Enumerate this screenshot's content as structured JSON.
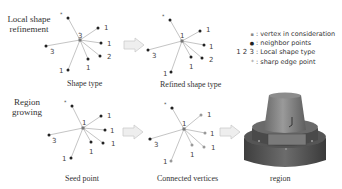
{
  "rows": {
    "top": {
      "label_line1": "Local shape",
      "label_line2": "refinement"
    },
    "bottom": {
      "label_line1": "Region",
      "label_line2": "growing"
    }
  },
  "panels": {
    "shape_type": {
      "caption": "Shape type",
      "center_label": "3",
      "neighbor_labels": [
        "1",
        "1",
        "2",
        "1",
        "1",
        "3"
      ]
    },
    "refined_shape_type": {
      "caption": "Refined shape type",
      "center_label": "1",
      "neighbor_labels": [
        "1",
        "1",
        "2",
        "1",
        "1",
        "3"
      ]
    },
    "seed_point": {
      "caption": "Seed point",
      "center_label": "1",
      "neighbor_labels": [
        "1",
        "1",
        "1",
        "1",
        "1",
        "3"
      ]
    },
    "connected_vertices": {
      "caption": "Connected vertices",
      "center_label": "1",
      "neighbor_labels": [
        "1",
        "1",
        "1",
        "1",
        "1",
        "3"
      ]
    },
    "region": {
      "caption": "region"
    }
  },
  "legend": {
    "items": [
      {
        "symbol": "▪",
        "icon": "vertex-icon",
        "label": ": vertex in consideration"
      },
      {
        "symbol": "●",
        "icon": "neighbor-point-icon",
        "label": ": neighbor points"
      },
      {
        "symbol": "1 2 3",
        "icon": "shape-type-numbers",
        "label": ": Local shape type"
      },
      {
        "symbol": "*",
        "icon": "sharp-edge-icon",
        "label": ": sharp edge point"
      }
    ]
  },
  "colors": {
    "edge": "#aaaaaa",
    "dot": "#222222",
    "gray_dot": "#999999",
    "arrow_fill": "#eeeeee",
    "arrow_stroke": "#cccccc"
  }
}
